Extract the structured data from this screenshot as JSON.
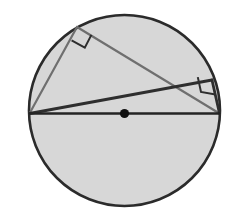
{
  "figure": {
    "canvas": {
      "width": 247,
      "height": 213,
      "background": "#ffffff"
    },
    "colors": {
      "circle_fill": "#d7d7d7",
      "circle_stroke": "#2b2b2b",
      "chord_stroke_dark": "#2e2e2e",
      "chord_stroke_gray": "#6f6f6f",
      "diameter_stroke": "#242424",
      "center_dot_fill": "#111111",
      "right_angle_stroke": "#2e2e2e"
    },
    "strokes": {
      "circle_width": 2.6,
      "diameter_width": 2.4,
      "chord_dark_width": 2.6,
      "chord_gray_width": 2.0,
      "right_angle_width": 2.0
    }
  },
  "circle": {
    "name": "main-circle",
    "center": {
      "x": 124.5,
      "y": 110.5
    },
    "radius": 95.5,
    "fill": "#d7d7d7",
    "stroke": "#2b2b2b"
  },
  "points": {
    "center": {
      "label": "O",
      "x": 124.5,
      "y": 113.5,
      "dot_radius": 4.6
    },
    "left_end": {
      "label": "A",
      "x": 29.5,
      "y": 113.5
    },
    "right_end": {
      "label": "B",
      "x": 219.5,
      "y": 113.5
    },
    "upper_left_vertex": {
      "label": "C",
      "x": 77.0,
      "y": 27.0
    },
    "right_vertex": {
      "label": "D",
      "x": 212.0,
      "y": 80.0
    }
  },
  "segments": [
    {
      "name": "diameter-AB",
      "from": "left_end",
      "to": "right_end",
      "x1": 29.5,
      "y1": 113.5,
      "x2": 219.5,
      "y2": 113.5,
      "stroke": "#242424",
      "width": 2.4
    },
    {
      "name": "chord-A-to-C",
      "from": "left_end",
      "to": "upper_left_vertex",
      "x1": 29.5,
      "y1": 113.5,
      "x2": 77.0,
      "y2": 27.0,
      "stroke": "#6f6f6f",
      "width": 2.2
    },
    {
      "name": "chord-C-to-B",
      "from": "upper_left_vertex",
      "to": "right_end",
      "x1": 77.0,
      "y1": 27.0,
      "x2": 219.5,
      "y2": 113.5,
      "stroke": "#6f6f6f",
      "width": 2.2
    },
    {
      "name": "chord-A-to-D",
      "from": "left_end",
      "to": "right_vertex",
      "x1": 29.5,
      "y1": 113.5,
      "x2": 212.0,
      "y2": 80.0,
      "stroke": "#2e2e2e",
      "width": 2.8
    },
    {
      "name": "chord-D-to-B",
      "from": "right_vertex",
      "to": "right_end",
      "x1": 212.0,
      "y1": 80.0,
      "x2": 219.5,
      "y2": 113.5,
      "stroke": "#2e2e2e",
      "width": 2.8
    }
  ],
  "right_angle_marks": [
    {
      "name": "right-angle-mark-upper-left",
      "at_vertex": "upper_left_vertex",
      "size": 15,
      "path": "M 71.6 40.3 L 84.8 47.6 L 91.4 34.9",
      "stroke": "#2e2e2e",
      "width": 2.0
    },
    {
      "name": "right-angle-mark-right",
      "at_vertex": "right_vertex",
      "size": 15,
      "path": "M 197.8 77.1 L 201.0 91.9 L 215.5 94.6",
      "stroke": "#2e2e2e",
      "width": 2.0
    }
  ],
  "chart_data": {
    "type": "diagram",
    "elements": [
      {
        "kind": "circle",
        "center_x": 124.5,
        "center_y": 110.5,
        "radius": 95.5,
        "filled": true
      },
      {
        "kind": "point",
        "name": "center",
        "x": 124.5,
        "y": 113.5
      },
      {
        "kind": "segment",
        "name": "diameter",
        "endpoints": [
          [
            29.5,
            113.5
          ],
          [
            219.5,
            113.5
          ]
        ]
      },
      {
        "kind": "triangle",
        "name": "triangle-ACB",
        "vertices": [
          [
            29.5,
            113.5
          ],
          [
            77.0,
            27.0
          ],
          [
            219.5,
            113.5
          ]
        ],
        "right_angle_at": [
          77.0,
          27.0
        ]
      },
      {
        "kind": "triangle",
        "name": "triangle-ADB",
        "vertices": [
          [
            29.5,
            113.5
          ],
          [
            212.0,
            80.0
          ],
          [
            219.5,
            113.5
          ]
        ],
        "right_angle_at": [
          212.0,
          80.0
        ]
      }
    ],
    "annotations": [
      "right angle at C",
      "right angle at D"
    ],
    "legend": [],
    "grid": false
  }
}
